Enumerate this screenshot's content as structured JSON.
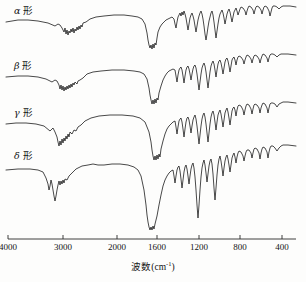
{
  "figure": {
    "type": "ir-spectra-figure",
    "background": "#fdfdfc",
    "line_color": "#1b1b1b"
  },
  "axis": {
    "title_main": "波数",
    "title_unit_open": "(cm",
    "title_unit_exp": "-1",
    "title_unit_close": ")",
    "ticks": [
      {
        "label": "4000",
        "x": 8
      },
      {
        "label": "3000",
        "x": 63
      },
      {
        "label": "2000",
        "x": 117
      },
      {
        "label": "1600",
        "x": 157
      },
      {
        "label": "1200",
        "x": 199
      },
      {
        "label": "800",
        "x": 240
      },
      {
        "label": "400",
        "x": 282
      }
    ],
    "line_y": 239,
    "line_x0": 8,
    "line_x1": 296
  },
  "curves": [
    {
      "name": "alpha",
      "label_glyph": "α",
      "label_text": "形",
      "label_x": 14,
      "label_y": 3
    },
    {
      "name": "beta",
      "label_glyph": "β",
      "label_text": "形",
      "label_x": 14,
      "label_y": 58
    },
    {
      "name": "gamma",
      "label_glyph": "γ",
      "label_text": "形",
      "label_x": 14,
      "label_y": 105
    },
    {
      "name": "delta",
      "label_glyph": "δ",
      "label_text": "形",
      "label_x": 14,
      "label_y": 148
    }
  ],
  "chart_data": {
    "type": "line",
    "title": "",
    "xlabel": "波数 (cm-1)",
    "ylabel": "",
    "xlim": [
      4000,
      400
    ],
    "x_axis_note": "non-linear: compressed above 2000 cm-1",
    "grid": false,
    "legend": "inline left labels",
    "xticks": [
      4000,
      3000,
      2000,
      1600,
      1200,
      800,
      400
    ],
    "series": [
      {
        "name": "α形",
        "baseline_y": 20,
        "path": "M 6,22 L 18,20 L 28,20 L 38,21 L 48,23 L 55,26 L 58,24 L 60,25 L 62,28 L 64,32 L 65,28 L 66,34 L 67,30 L 68,35 L 69,31 L 70,33 L 71,29 L 72,32 L 73,28 L 74,33 L 75,29 L 76,31 L 77,27 L 78,30 L 79,26 L 80,29 L 81,25 L 82,27 L 83,23 L 86,22 L 90,19 L 96,17 L 104,16 L 114,15 L 124,15 L 132,16 L 138,17 L 142,19 L 145,24 L 147,33 L 148,40 L 149,45 L 150,48 L 151,45 L 152,49 L 153,44 L 154,48 L 155,43 L 156,45 L 157,38 L 158,32 L 160,27 L 162,24 L 164,22 L 166,20 L 168,19 L 170,18 L 172,17 L 174,19 L 175,24 L 176,28 L 177,22 L 178,17 L 179,15 L 180,13 L 181,16 L 182,12 L 183,15 L 184,11 L 185,14 L 186,18 L 187,24 L 188,30 L 189,24 L 190,18 L 191,15 L 192,13 L 193,16 L 194,20 L 195,26 L 196,32 L 197,26 L 198,20 L 199,16 L 200,13 L 201,11 L 202,14 L 203,19 L 204,26 L 205,34 L 206,40 L 207,34 L 208,27 L 209,21 L 210,17 L 211,13 L 212,11 L 213,15 L 214,22 L 215,30 L 216,38 L 217,31 L 218,24 L 219,18 L 220,14 L 221,12 L 222,10 L 223,13 L 224,18 L 225,24 L 226,19 L 227,14 L 228,11 L 229,9 L 230,12 L 231,17 L 232,22 L 233,17 L 234,12 L 235,10 L 236,8 L 237,11 L 238,15 L 239,12 L 240,9 L 241,7 L 243,8 L 245,11 L 246,15 L 247,11 L 248,8 L 249,6 L 251,7 L 253,10 L 254,14 L 255,10 L 256,7 L 257,6 L 259,7 L 261,10 L 262,14 L 263,10 L 264,7 L 265,6 L 267,7 L 269,11 L 270,16 L 271,12 L 272,8 L 273,6 L 275,6 L 277,7 L 279,9 L 281,7 L 283,6 L 285,6 L 290,6 L 296,7"
      },
      {
        "name": "β形",
        "baseline_y": 75,
        "path": "M 6,77 L 18,76 L 28,76 L 38,77 L 46,79 L 52,82 L 55,80 L 57,81 L 59,85 L 60,89 L 61,85 L 62,90 L 63,86 L 64,91 L 65,87 L 66,90 L 67,86 L 68,89 L 69,85 L 70,88 L 71,84 L 72,87 L 73,83 L 74,85 L 75,82 L 77,84 L 78,81 L 80,80 L 83,78 L 87,74 L 93,72 L 101,71 L 112,70 L 124,70 L 134,71 L 140,72 L 144,74 L 147,79 L 149,88 L 150,95 L 151,100 L 152,104 L 153,100 L 154,104 L 155,99 L 156,103 L 157,98 L 158,100 L 159,93 L 161,86 L 163,80 L 165,76 L 167,73 L 169,71 L 171,70 L 173,69 L 175,70 L 176,76 L 177,82 L 178,75 L 179,70 L 180,68 L 181,67 L 182,70 L 183,76 L 184,83 L 185,76 L 186,70 L 187,67 L 188,66 L 189,69 L 190,74 L 191,80 L 192,74 L 193,69 L 194,66 L 195,65 L 196,68 L 197,74 L 198,82 L 199,90 L 200,82 L 201,74 L 202,68 L 203,65 L 204,63 L 205,66 L 206,72 L 207,80 L 208,88 L 209,80 L 210,72 L 211,66 L 212,63 L 213,61 L 214,64 L 215,70 L 216,77 L 217,70 L 218,64 L 219,61 L 220,60 L 221,63 L 222,68 L 223,74 L 224,68 L 225,62 L 226,59 L 227,58 L 228,61 L 229,66 L 230,72 L 231,66 L 232,60 L 233,58 L 234,57 L 235,60 L 236,65 L 237,60 L 238,57 L 239,56 L 241,57 L 243,60 L 244,64 L 245,60 L 246,57 L 247,55 L 249,56 L 251,59 L 252,63 L 253,59 L 254,56 L 255,55 L 257,56 L 259,59 L 260,63 L 261,59 L 262,56 L 263,54 L 265,55 L 267,58 L 268,62 L 269,58 L 270,55 L 271,54 L 273,54 L 275,55 L 277,57 L 279,55 L 281,54 L 283,54 L 288,54 L 296,55"
      },
      {
        "name": "γ形",
        "baseline_y": 122,
        "path": "M 6,124 L 16,123 L 26,123 L 36,124 L 44,126 L 50,131 L 53,128 L 55,132 L 57,137 L 58,142 L 59,146 L 60,141 L 61,145 L 62,139 L 63,143 L 64,138 L 65,141 L 66,136 L 67,139 L 68,134 L 69,137 L 70,132 L 72,134 L 74,130 L 76,131 L 78,127 L 81,125 L 85,121 L 91,118 L 99,116 L 110,115 L 122,115 L 133,116 L 140,118 L 145,122 L 149,132 L 151,142 L 152,150 L 153,156 L 154,160 L 155,156 L 156,160 L 157,155 L 158,159 L 159,154 L 160,157 L 161,149 L 163,141 L 165,134 L 167,129 L 169,126 L 171,124 L 173,122 L 175,121 L 176,127 L 177,134 L 178,127 L 179,121 L 180,119 L 181,118 L 182,122 L 183,129 L 184,137 L 185,129 L 186,122 L 187,118 L 188,117 L 189,120 L 190,126 L 191,133 L 192,126 L 193,120 L 194,117 L 195,115 L 196,119 L 197,126 L 198,135 L 199,144 L 200,135 L 201,126 L 202,119 L 203,115 L 204,113 L 205,117 L 206,124 L 207,133 L 208,142 L 209,133 L 210,124 L 211,117 L 212,113 L 213,111 L 214,115 L 215,122 L 216,130 L 217,122 L 218,115 L 219,112 L 220,110 L 221,114 L 222,120 L 223,127 L 224,120 L 225,113 L 226,110 L 227,108 L 228,112 L 229,118 L 230,125 L 231,118 L 232,111 L 233,108 L 234,107 L 235,110 L 236,116 L 237,110 L 238,106 L 239,105 L 241,106 L 243,110 L 244,115 L 245,110 L 246,106 L 247,104 L 249,105 L 251,109 L 252,114 L 253,109 L 254,105 L 255,104 L 257,105 L 259,108 L 260,113 L 261,108 L 262,105 L 263,103 L 265,104 L 267,108 L 268,113 L 269,108 L 270,104 L 271,103 L 273,103 L 275,104 L 277,107 L 279,104 L 281,103 L 283,102 L 288,102 L 296,103"
      },
      {
        "name": "δ形",
        "baseline_y": 168,
        "path": "M 6,170 L 18,169 L 30,169 L 38,170 L 43,172 L 46,178 L 48,184 L 49,190 L 50,186 L 51,180 L 52,184 L 53,190 L 54,196 L 55,201 L 56,196 L 57,190 L 58,185 L 59,181 L 60,185 L 61,181 L 62,184 L 63,180 L 64,183 L 65,179 L 67,180 L 69,176 L 72,173 L 76,169 L 82,166 L 88,165 L 93,164 L 98,165 L 104,165 L 112,164 L 120,164 L 128,165 L 134,167 L 138,170 L 141,176 L 144,190 L 146,205 L 147,215 L 148,222 L 149,227 L 150,230 L 151,227 L 152,230 L 153,226 L 154,229 L 155,224 L 157,216 L 159,205 L 161,195 L 163,186 L 165,180 L 167,176 L 169,173 L 171,171 L 173,170 L 174,176 L 175,183 L 176,176 L 177,170 L 178,167 L 179,166 L 180,171 L 181,179 L 182,188 L 183,180 L 184,172 L 185,167 L 186,165 L 187,169 L 188,176 L 189,184 L 190,176 L 191,169 L 192,165 L 193,163 L 194,168 L 195,177 L 196,190 L 197,205 L 198,218 L 199,205 L 200,190 L 201,177 L 202,168 L 203,163 L 204,160 L 205,165 L 206,173 L 207,182 L 208,174 L 209,166 L 210,161 L 211,159 L 212,164 L 213,174 L 214,188 L 215,200 L 216,188 L 217,175 L 218,165 L 219,159 L 220,156 L 221,161 L 222,168 L 223,176 L 224,168 L 225,161 L 226,157 L 227,155 L 228,159 L 229,165 L 230,172 L 231,165 L 232,158 L 233,155 L 234,153 L 235,157 L 236,163 L 237,157 L 238,153 L 239,151 L 241,152 L 243,156 L 244,161 L 245,156 L 246,152 L 247,150 L 249,150 L 251,153 L 252,158 L 253,153 L 254,149 L 255,148 L 257,149 L 259,153 L 260,159 L 261,153 L 262,149 L 263,147 L 265,148 L 267,152 L 268,158 L 269,152 L 270,148 L 271,146 L 273,146 L 275,148 L 277,151 L 279,148 L 281,146 L 283,145 L 288,145 L 296,146"
      }
    ]
  }
}
